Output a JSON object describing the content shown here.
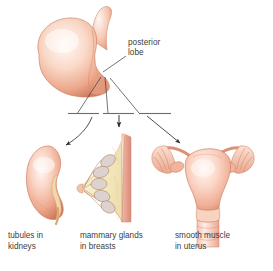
{
  "figure": {
    "background_color": "#ffffff"
  },
  "source_label": {
    "name": "posterior-lobe",
    "line1": "posterior",
    "line2": "lobe",
    "text": "posterior lobe"
  },
  "targets": [
    {
      "id": "kidney",
      "line1": "tubules in",
      "line2": "kidneys",
      "text": "tubules in kidneys",
      "organ": "kidney"
    },
    {
      "id": "breast",
      "line1": "mammary glands",
      "line2": "in breasts",
      "text": "mammary glands in breasts",
      "organ": "breast-cross-section"
    },
    {
      "id": "uterus",
      "line1": "smooth muscle",
      "line2": "in uterus",
      "text": "smooth muscle in uterus",
      "organ": "uterus"
    }
  ],
  "colors": {
    "text": "#3d3d3d",
    "line": "#4a4a4a",
    "organ_outline": "#c9705a",
    "organ_fill_light": "#fdf1ec",
    "organ_fill_mid": "#f2b79e",
    "organ_fill_deep": "#d9795c",
    "gland_highlight": "#fdf6f2",
    "breast_interior": "#f6ecc4",
    "breast_lobule": "#ded0cf",
    "breast_wall": "#e8a795",
    "kidney_hilum": "#f4d9ae",
    "background": "#ffffff"
  },
  "connectors": {
    "fan_lines": 3,
    "divider_dashes": 3,
    "arrows": [
      {
        "id": "arrow-to-kidney",
        "style": "curved",
        "direction": "down-left"
      },
      {
        "id": "arrow-to-breast",
        "style": "straight",
        "direction": "down"
      },
      {
        "id": "arrow-to-uterus",
        "style": "straight",
        "direction": "down-right"
      }
    ],
    "leader_line": {
      "id": "leader-posterior-lobe",
      "direction": "down-left"
    }
  }
}
